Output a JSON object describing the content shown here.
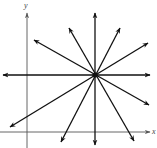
{
  "diagram": {
    "colors": {
      "background": "#ffffff",
      "stroke": "#111111",
      "axis": "#555555"
    },
    "axes": {
      "x_label": "x",
      "y_label": "y",
      "x_axis": {
        "x1": 0,
        "y1": 132,
        "x2": 150,
        "y2": 132
      },
      "y_axis": {
        "x1": 27,
        "y1": 148,
        "x2": 27,
        "y2": 13
      },
      "x_label_pos": {
        "x": 152,
        "y": 134
      },
      "y_label_pos": {
        "x": 24,
        "y": 8
      }
    },
    "center": {
      "x": 95,
      "y": 75,
      "label": "common point"
    },
    "lines": [
      {
        "name": "vertical",
        "a": {
          "x": 95,
          "y": 13
        },
        "b": {
          "x": 95,
          "y": 145
        }
      },
      {
        "name": "horizontal",
        "a": {
          "x": 3,
          "y": 75
        },
        "b": {
          "x": 150,
          "y": 75
        }
      },
      {
        "name": "steep-positive",
        "a": {
          "x": 120,
          "y": 28
        },
        "b": {
          "x": 61,
          "y": 142
        }
      },
      {
        "name": "steep-negative",
        "a": {
          "x": 69,
          "y": 28
        },
        "b": {
          "x": 134,
          "y": 141
        }
      },
      {
        "name": "shallow-positive",
        "a": {
          "x": 148,
          "y": 43
        },
        "b": {
          "x": 10,
          "y": 127
        }
      },
      {
        "name": "shallow-negative",
        "a": {
          "x": 34,
          "y": 40
        },
        "b": {
          "x": 149,
          "y": 105
        }
      }
    ]
  }
}
